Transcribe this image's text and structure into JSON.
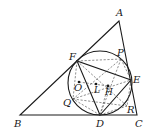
{
  "figure": {
    "type": "geometry-diagram",
    "points": {
      "A": {
        "label": "A",
        "x": 119,
        "y": 21
      },
      "B": {
        "label": "B",
        "x": 20,
        "y": 115
      },
      "C": {
        "label": "C",
        "x": 137,
        "y": 115
      },
      "D": {
        "label": "D",
        "x": 100,
        "y": 115
      },
      "E": {
        "label": "E",
        "x": 131,
        "y": 80
      },
      "F": {
        "label": "F",
        "x": 77,
        "y": 61
      },
      "P": {
        "label": "P",
        "x": 121,
        "y": 59
      },
      "Q": {
        "label": "Q",
        "x": 73,
        "y": 99
      },
      "R": {
        "label": "R",
        "x": 127,
        "y": 106
      },
      "O": {
        "label": "O",
        "x": 79,
        "y": 82
      },
      "L": {
        "label": "L",
        "x": 96,
        "y": 84
      },
      "H": {
        "label": "H",
        "x": 108,
        "y": 86
      }
    },
    "circle": {
      "cx": 100,
      "cy": 83,
      "r": 32
    },
    "colors": {
      "stroke": "#1a1a1a",
      "dashed": "#444444",
      "background": "#ffffff"
    }
  }
}
